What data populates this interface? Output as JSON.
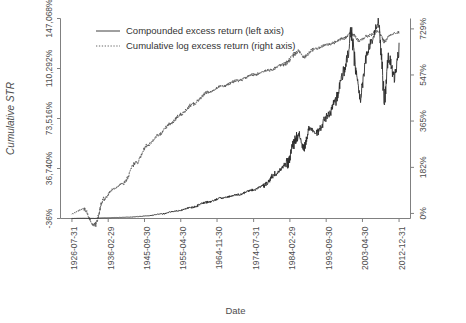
{
  "chart_data": {
    "type": "line",
    "title": "",
    "xlabel": "Date",
    "ylabel": "Cumulative STR",
    "grid": false,
    "legend_position": "top-left-inside",
    "x_tick_labels": [
      "1926-07-31",
      "1936-02-29",
      "1945-09-30",
      "1955-04-30",
      "1964-11-30",
      "1974-07-31",
      "1984-02-29",
      "1993-09-30",
      "2003-04-30",
      "2012-12-31"
    ],
    "x_tick_rotation_deg": 90,
    "left_axis": {
      "name": "Compounded excess return (left axis)",
      "tick_labels": [
        "-36%",
        "36,740%",
        "73,516%",
        "110,292%",
        "147,068%"
      ],
      "tick_values": [
        -36,
        36740,
        73516,
        110292,
        147068
      ],
      "ylim": [
        -36,
        147068
      ]
    },
    "right_axis": {
      "name": "Cumulative log excess return (right axis)",
      "tick_labels": [
        "0%",
        "182%",
        "365%",
        "547%",
        "729%"
      ],
      "tick_values": [
        0,
        182,
        365,
        547,
        729
      ],
      "ylim": [
        -20,
        770
      ]
    },
    "series": [
      {
        "name": "Compounded excess return (left axis)",
        "axis": "left",
        "style": "solid",
        "color": "#2b2b2b",
        "x": [
          "1926-07-31",
          "1929-01-31",
          "1932-06-30",
          "1935-01-31",
          "1938-06-30",
          "1942-01-31",
          "1946-06-30",
          "1950-01-31",
          "1954-06-30",
          "1958-01-31",
          "1962-06-30",
          "1966-01-31",
          "1970-06-30",
          "1974-07-31",
          "1977-01-31",
          "1980-06-30",
          "1983-01-31",
          "1986-06-30",
          "1987-10-31",
          "1989-06-30",
          "1991-01-31",
          "1994-06-30",
          "1996-01-31",
          "1998-06-30",
          "1999-06-30",
          "2000-03-31",
          "2001-09-30",
          "2002-09-30",
          "2003-04-30",
          "2004-06-30",
          "2005-10-31",
          "2007-06-30",
          "2007-10-31",
          "2009-02-28",
          "2010-04-30",
          "2011-09-30",
          "2012-12-31"
        ],
        "values_pct": [
          0,
          120,
          60,
          420,
          700,
          980,
          1900,
          3300,
          5600,
          8100,
          12000,
          15000,
          17500,
          21000,
          24000,
          33000,
          40000,
          62000,
          52000,
          66000,
          63000,
          76000,
          86000,
          108000,
          120000,
          138000,
          108000,
          86000,
          99000,
          122000,
          131000,
          146000,
          139000,
          88000,
          118000,
          104000,
          124000
        ]
      },
      {
        "name": "Cumulative log excess return (right axis)",
        "axis": "right",
        "style": "dotted",
        "color": "#555555",
        "x": [
          "1926-07-31",
          "1929-08-31",
          "1932-06-30",
          "1935-01-31",
          "1937-06-30",
          "1940-01-31",
          "1943-06-30",
          "1946-06-30",
          "1949-06-30",
          "1952-06-30",
          "1955-04-30",
          "1958-06-30",
          "1962-06-30",
          "1966-01-31",
          "1970-06-30",
          "1974-07-31",
          "1978-06-30",
          "1982-06-30",
          "1986-06-30",
          "1987-10-31",
          "1990-06-30",
          "1994-06-30",
          "1998-06-30",
          "2000-03-31",
          "2002-09-30",
          "2004-06-30",
          "2007-06-30",
          "2009-02-28",
          "2010-06-30",
          "2012-12-31"
        ],
        "values_pct": [
          0,
          18,
          -48,
          58,
          96,
          120,
          200,
          268,
          310,
          352,
          392,
          432,
          478,
          502,
          525,
          548,
          565,
          588,
          640,
          618,
          648,
          668,
          692,
          712,
          682,
          700,
          720,
          678,
          706,
          716
        ]
      }
    ]
  },
  "legend": {
    "items": [
      {
        "label": "Compounded excess return (left axis)",
        "style": "solid"
      },
      {
        "label": "Cumulative log excess return (right axis)",
        "style": "dotted"
      }
    ]
  }
}
